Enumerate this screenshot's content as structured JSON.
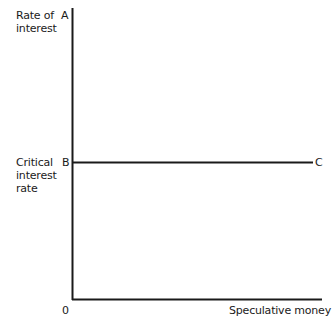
{
  "diagram": {
    "y_axis_label": "Rate of\ninterest",
    "critical_label": "Critical\ninterest\nrate",
    "x_axis_label": "Speculative money",
    "origin_label": "0",
    "points": {
      "A": "A",
      "B": "B",
      "C": "C"
    },
    "line_color": "#1a1a1a"
  }
}
